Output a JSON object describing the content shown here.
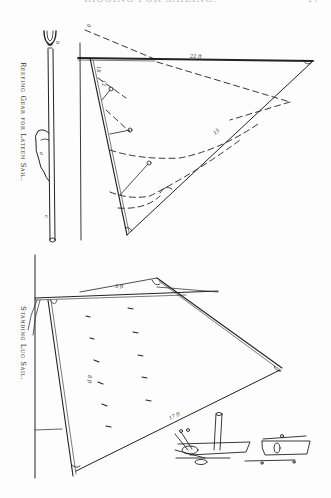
{
  "page": {
    "running_head": "RIGGING FOR SAILING.",
    "page_number": "47"
  },
  "figures": [
    {
      "id": "reefing-gear",
      "caption": "Reefing Gear for Lateen Sail.",
      "labels": [
        "b",
        "a",
        "c",
        "g",
        "22 ft",
        "18",
        "12",
        "15"
      ]
    },
    {
      "id": "standing-lug",
      "caption": "Standing Lug Sail.",
      "labels": [
        "13",
        "11",
        "14",
        "16",
        "17",
        "18",
        "19",
        "20",
        "a",
        "b",
        "c",
        "d",
        "e"
      ]
    }
  ],
  "colors": {
    "ink": "#222222",
    "paper": "#fdfdfd"
  }
}
